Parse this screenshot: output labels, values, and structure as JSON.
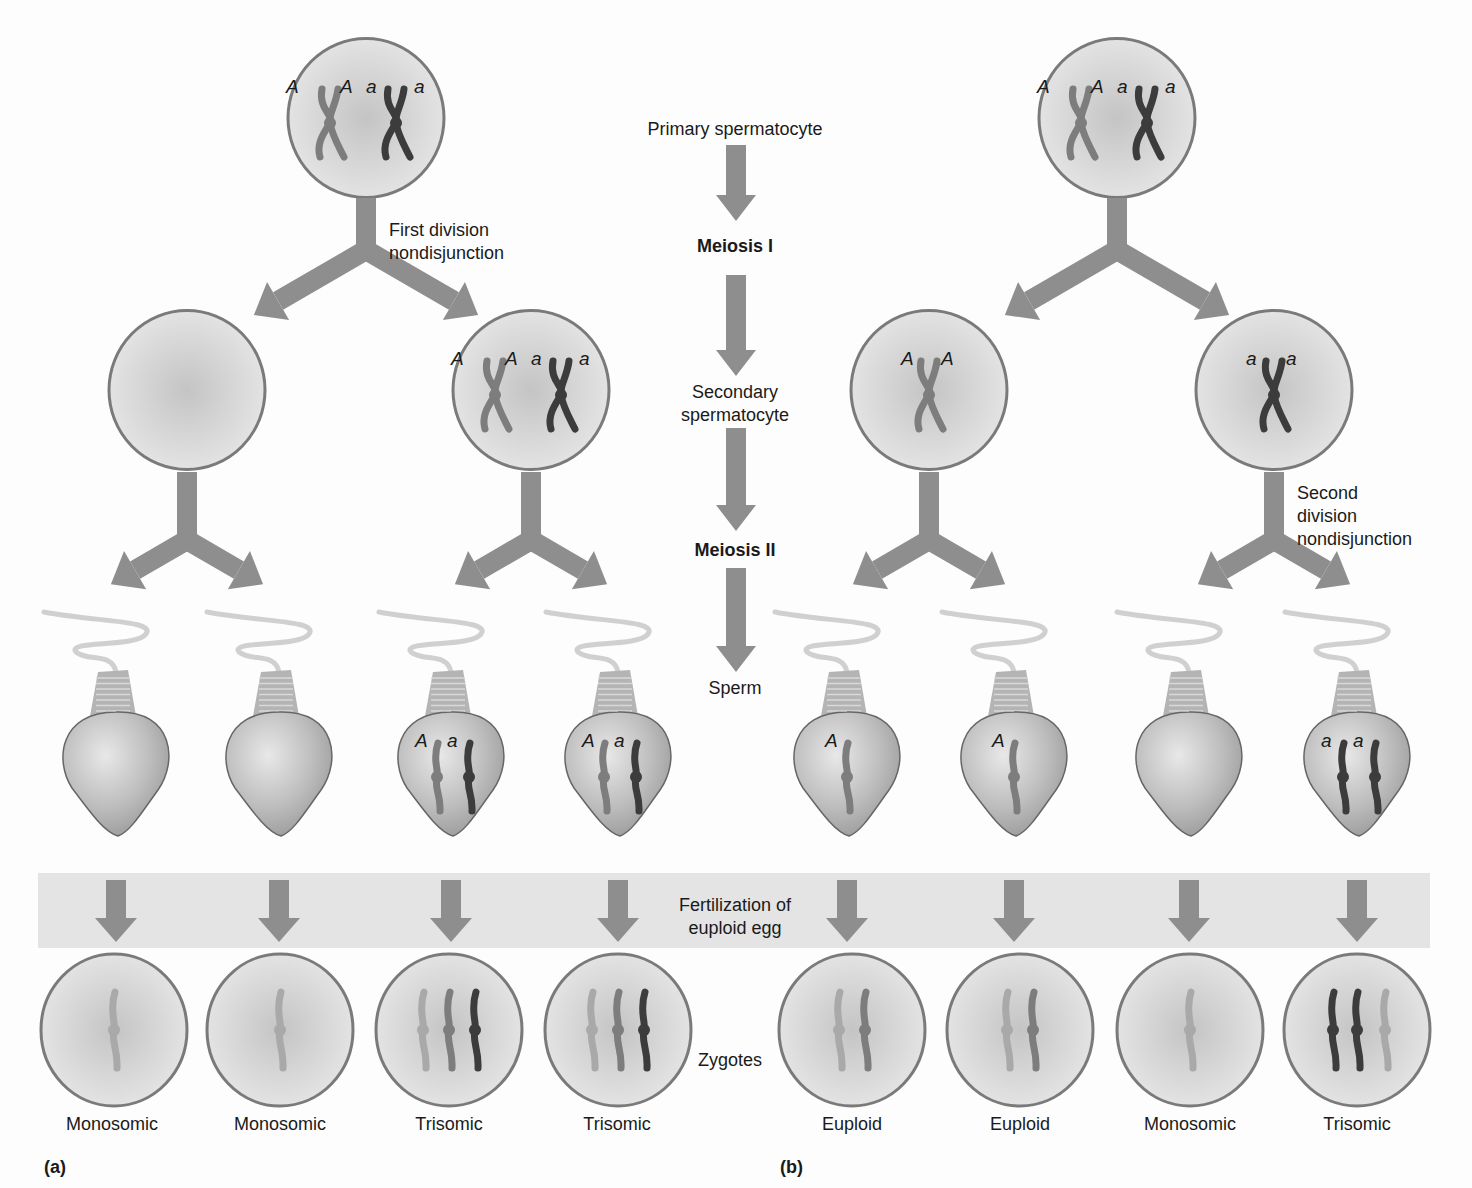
{
  "colors": {
    "arrow": "#8e8e8e",
    "cell_fill": "#d6d6d6",
    "cell_stroke": "#7a7a7a",
    "band": "#e4e4e4",
    "chrom_A": "#7d7d7d",
    "chrom_a": "#3c3c3c",
    "chrom_light": "#a9a9a9",
    "text": "#1a1a1a"
  },
  "center_column": {
    "primary": "Primary spermatocyte",
    "meiosis1": "Meiosis I",
    "secondary_line1": "Secondary",
    "secondary_line2": "spermatocyte",
    "meiosis2": "Meiosis II",
    "sperm": "Sperm",
    "fertilization_line1": "Fertilization of",
    "fertilization_line2": "euploid egg",
    "zygotes": "Zygotes"
  },
  "panel_a": {
    "label": "(a)",
    "event_line1": "First division",
    "event_line2": "nondisjunction",
    "primary_alleles": [
      "A",
      "A",
      "a",
      "a"
    ],
    "secondary_cells": [
      {
        "alleles": []
      },
      {
        "alleles": [
          "A",
          "A",
          "a",
          "a"
        ]
      }
    ],
    "sperm": [
      {
        "alleles": []
      },
      {
        "alleles": []
      },
      {
        "alleles": [
          "A",
          "a"
        ]
      },
      {
        "alleles": [
          "A",
          "a"
        ]
      }
    ],
    "zygotes": [
      "Monosomic",
      "Monosomic",
      "Trisomic",
      "Trisomic"
    ]
  },
  "panel_b": {
    "label": "(b)",
    "event_line1": "Second",
    "event_line2": "division",
    "event_line3": "nondisjunction",
    "primary_alleles": [
      "A",
      "A",
      "a",
      "a"
    ],
    "secondary_cells": [
      {
        "alleles": [
          "A",
          "A"
        ]
      },
      {
        "alleles": [
          "a",
          "a"
        ]
      }
    ],
    "sperm": [
      {
        "alleles": [
          "A"
        ]
      },
      {
        "alleles": [
          "A"
        ]
      },
      {
        "alleles": []
      },
      {
        "alleles": [
          "a",
          "a"
        ]
      }
    ],
    "zygotes": [
      "Euploid",
      "Euploid",
      "Monosomic",
      "Trisomic"
    ]
  }
}
